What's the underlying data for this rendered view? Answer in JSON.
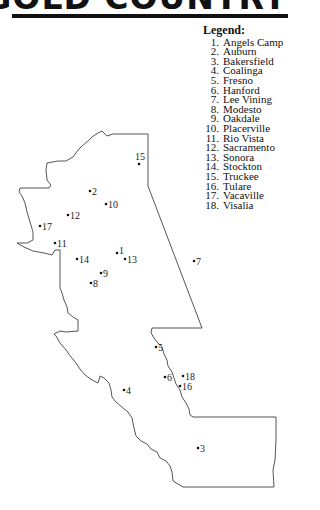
{
  "banner": {
    "title": "GOLD COUNTRY"
  },
  "legend": {
    "title": "Legend:",
    "items": [
      {
        "num": "1.",
        "name": "Angels Camp"
      },
      {
        "num": "2.",
        "name": "Auburn"
      },
      {
        "num": "3.",
        "name": "Bakersfield"
      },
      {
        "num": "4.",
        "name": "Coalinga"
      },
      {
        "num": "5.",
        "name": "Fresno"
      },
      {
        "num": "6.",
        "name": "Hanford"
      },
      {
        "num": "7.",
        "name": "Lee Vining"
      },
      {
        "num": "8.",
        "name": "Modesto"
      },
      {
        "num": "9.",
        "name": "Oakdale"
      },
      {
        "num": "10.",
        "name": "Placerville"
      },
      {
        "num": "11.",
        "name": "Rio Vista"
      },
      {
        "num": "12.",
        "name": "Sacramento"
      },
      {
        "num": "13.",
        "name": "Sonora"
      },
      {
        "num": "14.",
        "name": "Stockton"
      },
      {
        "num": "15.",
        "name": "Truckee"
      },
      {
        "num": "16.",
        "name": "Tulare"
      },
      {
        "num": "17.",
        "name": "Vacaville"
      },
      {
        "num": "18.",
        "name": "Visalia"
      }
    ]
  },
  "map": {
    "outline_color": "#555555",
    "cities": [
      {
        "label": "15",
        "x": 139,
        "y": 164,
        "lx": 135,
        "ly": 160,
        "above": true
      },
      {
        "label": "2",
        "x": 90,
        "y": 191
      },
      {
        "label": "10",
        "x": 106,
        "y": 204
      },
      {
        "label": "12",
        "x": 68,
        "y": 215
      },
      {
        "label": "17",
        "x": 40,
        "y": 226
      },
      {
        "label": "11",
        "x": 55,
        "y": 243
      },
      {
        "label": "1",
        "x": 117,
        "y": 253,
        "raised": true
      },
      {
        "label": "14",
        "x": 77,
        "y": 259
      },
      {
        "label": "13",
        "x": 125,
        "y": 259
      },
      {
        "label": "7",
        "x": 194,
        "y": 261
      },
      {
        "label": "9",
        "x": 101,
        "y": 273
      },
      {
        "label": "8",
        "x": 91,
        "y": 283
      },
      {
        "label": "5",
        "x": 156,
        "y": 347
      },
      {
        "label": "6",
        "x": 165,
        "y": 377
      },
      {
        "label": "18",
        "x": 183,
        "y": 376
      },
      {
        "label": "16",
        "x": 180,
        "y": 386
      },
      {
        "label": "4",
        "x": 124,
        "y": 390
      },
      {
        "label": "3",
        "x": 198,
        "y": 448
      }
    ]
  }
}
